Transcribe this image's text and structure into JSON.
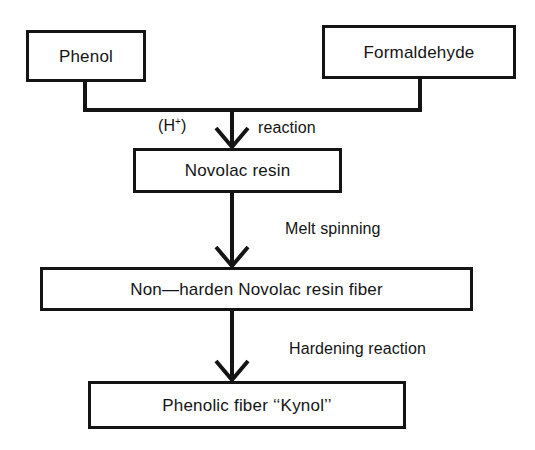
{
  "diagram": {
    "background_color": "#ffffff",
    "line_color": "#141414",
    "nodes": [
      {
        "id": "phenol",
        "label": "Phenol"
      },
      {
        "id": "formaldehyde",
        "label": "Formaldehyde"
      },
      {
        "id": "novolac",
        "label": "Novolac resin"
      },
      {
        "id": "nonharden",
        "label": "Non—harden Novolac resin fiber"
      },
      {
        "id": "kynol",
        "label": "Phenolic fiber ‘‘Kynol’’"
      }
    ],
    "edge_labels": [
      {
        "id": "hplus",
        "text": "(H",
        "superscript": "+",
        "suffix": ")"
      },
      {
        "id": "reaction",
        "text": "reaction"
      },
      {
        "id": "melt",
        "text": "Melt spinning"
      },
      {
        "id": "harden",
        "text": "Hardening reaction"
      }
    ],
    "edges": [
      {
        "from": "phenol",
        "to": "novolac",
        "label": "(H+) reaction"
      },
      {
        "from": "formaldehyde",
        "to": "novolac",
        "label": "(H+) reaction"
      },
      {
        "from": "novolac",
        "to": "nonharden",
        "label": "Melt spinning"
      },
      {
        "from": "nonharden",
        "to": "kynol",
        "label": "Hardening reaction"
      }
    ]
  }
}
